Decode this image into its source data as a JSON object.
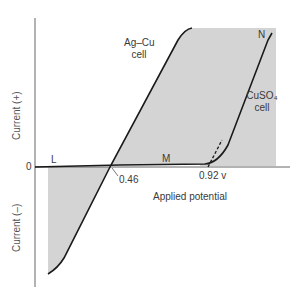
{
  "diagram": {
    "type": "current-potential curves",
    "y_axis": {
      "positive_label": "Current  (+)",
      "negative_label": "Current  (–)",
      "zero_label": "0"
    },
    "x_axis": {
      "label": "Applied potential"
    },
    "curves": [
      {
        "name": "Ag–Cu cell",
        "line1": "Ag–Cu",
        "line2": "cell"
      },
      {
        "name": "CuSO4 cell",
        "line1": "CuSO₄",
        "line2": "cell"
      }
    ],
    "points": {
      "L": "L",
      "M": "M",
      "N": "N"
    },
    "annotations": {
      "crossing": "0.46",
      "decomposition": "0.92 v"
    },
    "colors": {
      "shade": "#d4d4d4",
      "line": "#1a1a1a",
      "axis": "#555555"
    }
  }
}
